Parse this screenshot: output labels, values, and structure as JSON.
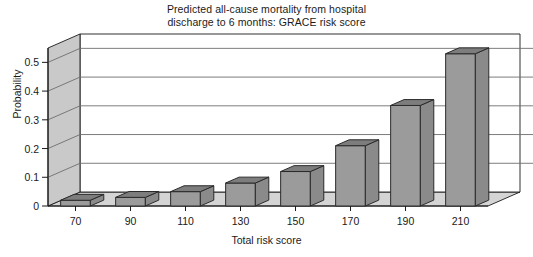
{
  "chart_data": {
    "type": "bar",
    "title": "Predicted all-cause mortality from hospital discharge to 6 months: GRACE risk score",
    "title_lines": [
      "Predicted all-cause mortality from hospital",
      "discharge to 6 months: GRACE risk score"
    ],
    "xlabel": "Total risk score",
    "ylabel": "Probability",
    "categories": [
      "70",
      "90",
      "110",
      "130",
      "150",
      "170",
      "190",
      "210"
    ],
    "values": [
      0.02,
      0.03,
      0.05,
      0.08,
      0.12,
      0.21,
      0.35,
      0.53
    ],
    "ylim": [
      0,
      0.55
    ],
    "ytick_labels": [
      "0",
      "0.1",
      "0.2",
      "0.3",
      "0.4",
      "0.5"
    ],
    "ytick_values": [
      0,
      0.1,
      0.2,
      0.3,
      0.4,
      0.5
    ],
    "grid": true,
    "legend": "none",
    "style": "3d-bar",
    "colors": {
      "bar_front": "#9b9b9b",
      "bar_top": "#7d7d7d",
      "bar_side": "#8a8a8a",
      "bar_outline": "#2b2b2b",
      "floor": "#d4d4d4",
      "wall": "#ffffff",
      "wall_side": "#c9c9c9",
      "gridline": "#6e6e6e",
      "axis": "#1a1a1a",
      "text": "#1a1a1a"
    }
  }
}
